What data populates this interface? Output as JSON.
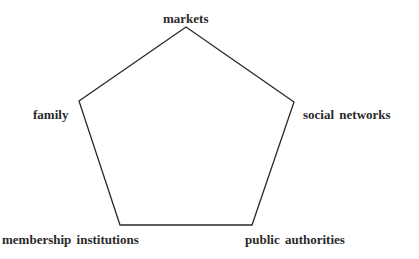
{
  "diagram": {
    "type": "pentagon",
    "line_color": "#2a2a2a",
    "vertices": [
      {
        "name": "markets",
        "x": 186,
        "y": 27
      },
      {
        "name": "social networks",
        "x": 294,
        "y": 102
      },
      {
        "name": "public authorities",
        "x": 252,
        "y": 225
      },
      {
        "name": "membership institutions",
        "x": 120,
        "y": 225
      },
      {
        "name": "family",
        "x": 79,
        "y": 101
      }
    ],
    "labels": {
      "markets": "markets",
      "social_networks": "social networks",
      "public_authorities": "public authorities",
      "membership_institutions": "membership institutions",
      "family": "family"
    }
  }
}
